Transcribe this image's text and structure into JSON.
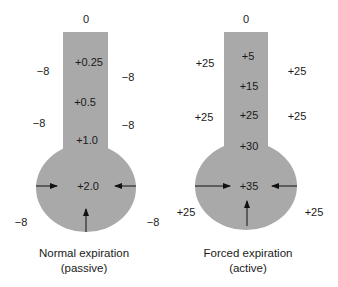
{
  "fill_color": "#a9a9a9",
  "diagrams": [
    {
      "name": "normal",
      "top_label": "0",
      "column_values": [
        "+0.25",
        "+0.5",
        "+1.0"
      ],
      "bulb_value": "+2.0",
      "outside_left": [
        "−8",
        "−8",
        "−8"
      ],
      "outside_right": [
        "−8",
        "−8",
        "−8"
      ],
      "caption_line1": "Normal expiration",
      "caption_line2": "(passive)"
    },
    {
      "name": "forced",
      "top_label": "0",
      "column_values": [
        "+5",
        "+15",
        "+25",
        "+30"
      ],
      "bulb_value": "+35",
      "outside_left": [
        "+25",
        "+25",
        "+25"
      ],
      "outside_right": [
        "+25",
        "+25",
        "+25"
      ],
      "caption_line1": "Forced expiration",
      "caption_line2": "(active)"
    }
  ]
}
